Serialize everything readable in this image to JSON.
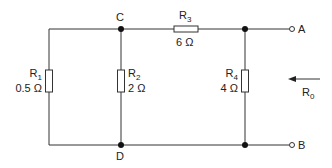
{
  "diagram": {
    "type": "circuit",
    "nodes": {
      "C": "C",
      "D": "D",
      "A": "A",
      "B": "B"
    },
    "resistors": [
      {
        "id": "R1",
        "name": "R",
        "sub": "1",
        "value": "0.5 Ω"
      },
      {
        "id": "R2",
        "name": "R",
        "sub": "2",
        "value": "2 Ω"
      },
      {
        "id": "R3",
        "name": "R",
        "sub": "3",
        "value": "6 Ω"
      },
      {
        "id": "R4",
        "name": "R",
        "sub": "4",
        "value": "4 Ω"
      }
    ],
    "equivalent": {
      "name": "R",
      "sub": "0"
    },
    "colors": {
      "wire": "#333333",
      "node": "#111111",
      "background": "#ffffff"
    }
  }
}
